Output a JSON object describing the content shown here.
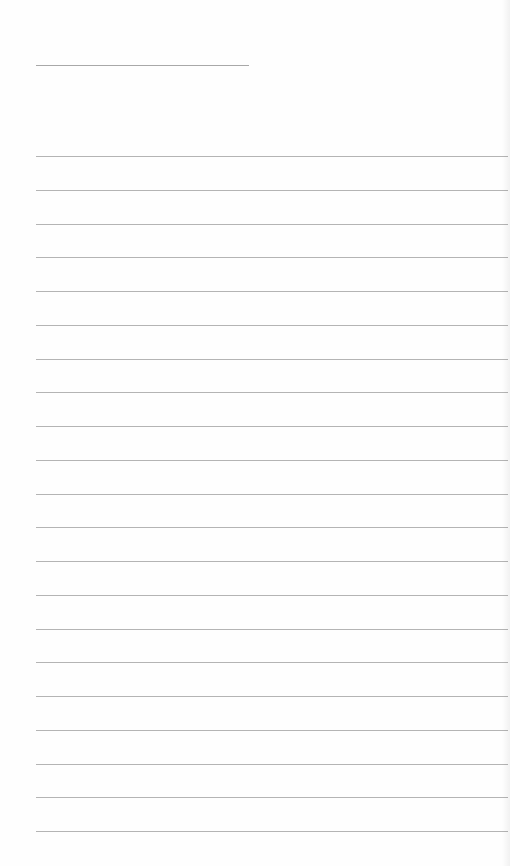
{
  "page": {
    "type": "lined notepad page",
    "background_color": "#fefefe",
    "line_color": "#b4b4b4",
    "title": "",
    "line_count": 21,
    "lines": [
      "",
      "",
      "",
      "",
      "",
      "",
      "",
      "",
      "",
      "",
      "",
      "",
      "",
      "",
      "",
      "",
      "",
      "",
      "",
      "",
      ""
    ]
  }
}
